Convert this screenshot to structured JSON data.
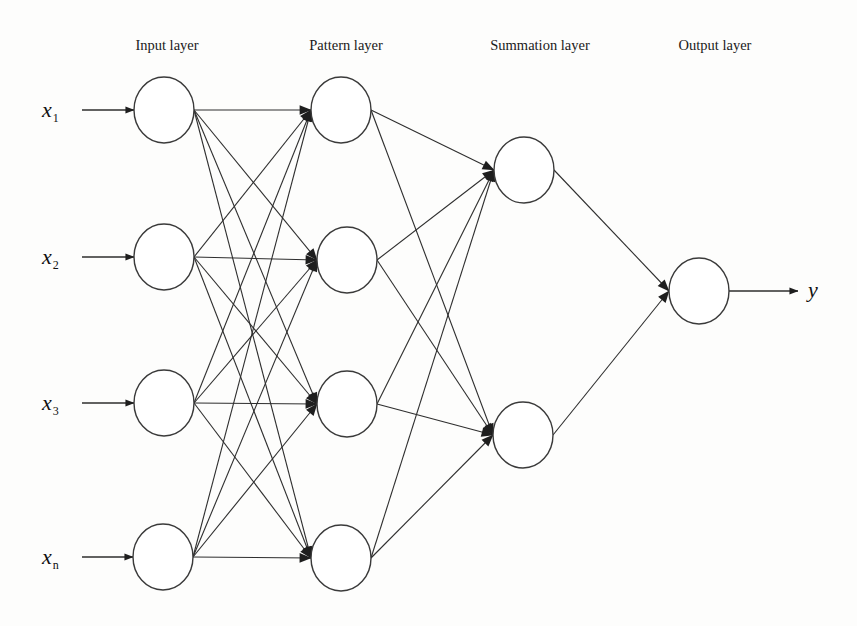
{
  "diagram": {
    "type": "neural-network",
    "name": "General Regression Neural Network architecture",
    "layers": [
      {
        "id": "input",
        "title": "Input layer",
        "title_x": 167,
        "nodes": [
          {
            "id": "in1",
            "label": "x",
            "sub": "1",
            "cx": 164,
            "cy": 110
          },
          {
            "id": "in2",
            "label": "x",
            "sub": "2",
            "cx": 164,
            "cy": 257
          },
          {
            "id": "in3",
            "label": "x",
            "sub": "3",
            "cx": 164,
            "cy": 403
          },
          {
            "id": "inn",
            "label": "x",
            "sub": "n",
            "cx": 163,
            "cy": 557
          }
        ]
      },
      {
        "id": "pattern",
        "title": "Pattern  layer",
        "title_x": 346,
        "nodes": [
          {
            "id": "p1",
            "cx": 341,
            "cy": 110
          },
          {
            "id": "p2",
            "cx": 347,
            "cy": 260
          },
          {
            "id": "p3",
            "cx": 347,
            "cy": 404
          },
          {
            "id": "p4",
            "cx": 341,
            "cy": 558
          }
        ]
      },
      {
        "id": "summation",
        "title": "Summation layer",
        "title_x": 540,
        "nodes": [
          {
            "id": "s1",
            "cx": 524,
            "cy": 170
          },
          {
            "id": "s2",
            "cx": 523,
            "cy": 435
          }
        ]
      },
      {
        "id": "output",
        "title": "Output layer",
        "title_x": 715,
        "nodes": [
          {
            "id": "o1",
            "label": "y",
            "cx": 699,
            "cy": 291
          }
        ]
      }
    ],
    "connections": [
      {
        "from": "input",
        "to": "pattern",
        "pattern": "fully-connected"
      },
      {
        "from": "pattern",
        "to": "summation",
        "pattern": "fully-connected"
      },
      {
        "from": "summation",
        "to": "output",
        "pattern": "fully-connected"
      }
    ],
    "node_radius_x": 30,
    "node_radius_y": 33,
    "title_y": 50,
    "colors": {
      "stroke": "#2e2e2e",
      "node_fill": "#ffffff",
      "background": "#fdfdfc"
    }
  }
}
